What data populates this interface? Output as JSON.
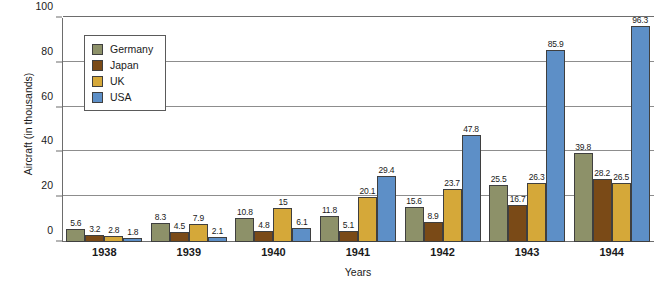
{
  "chart_data": {
    "type": "bar",
    "title": "",
    "xlabel": "Years",
    "ylabel": "Aircraft (in thousands)",
    "ylim": [
      0,
      100
    ],
    "yticks": [
      0,
      20,
      40,
      60,
      80,
      100
    ],
    "grid": true,
    "legend_position": "upper-left-inside",
    "categories": [
      "1938",
      "1939",
      "1940",
      "1941",
      "1942",
      "1943",
      "1944"
    ],
    "series": [
      {
        "name": "Germany",
        "color": "#8d9169",
        "values": [
          5.6,
          8.3,
          10.8,
          11.8,
          15.6,
          25.5,
          39.8
        ],
        "labels": [
          "5.6",
          "8.3",
          "10.8",
          "11.8",
          "15.6",
          "25.5",
          "39.8"
        ]
      },
      {
        "name": "Japan",
        "color": "#7a4a17",
        "values": [
          3.2,
          4.5,
          4.8,
          5.1,
          8.9,
          16.7,
          28.2
        ],
        "labels": [
          "3.2",
          "4.5",
          "4.8",
          "5.1",
          "8.9",
          "16.7",
          "28.2"
        ]
      },
      {
        "name": "UK",
        "color": "#d5a839",
        "values": [
          2.8,
          7.9,
          15,
          20.1,
          23.7,
          26.3,
          26.5
        ],
        "labels": [
          "2.8",
          "7.9",
          "15",
          "20.1",
          "23.7",
          "26.3",
          "26.5"
        ]
      },
      {
        "name": "USA",
        "color": "#5d8fc7",
        "values": [
          1.8,
          2.1,
          6.1,
          29.4,
          47.8,
          85.9,
          96.3
        ],
        "labels": [
          "1.8",
          "2.1",
          "6.1",
          "29.4",
          "47.8",
          "85.9",
          "96.3"
        ]
      }
    ]
  },
  "legend": {
    "items": [
      {
        "label": "Germany",
        "color": "#8d9169"
      },
      {
        "label": "Japan",
        "color": "#7a4a17"
      },
      {
        "label": "UK",
        "color": "#d5a839"
      },
      {
        "label": "USA",
        "color": "#5d8fc7"
      }
    ]
  }
}
